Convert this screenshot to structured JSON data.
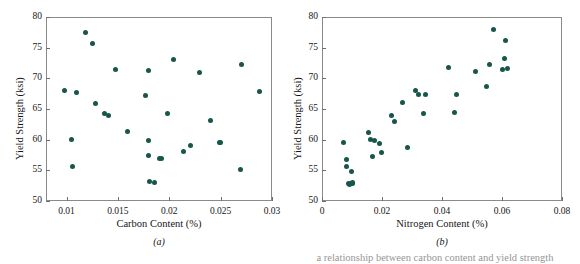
{
  "figure": {
    "caption_fragment": "a relationship between carbon content and yield strength",
    "point_color": "#17564a",
    "frame_color": "#8a8a8a"
  },
  "chart_data": [
    {
      "type": "scatter",
      "panel_label": "(a)",
      "title": "",
      "xlabel": "Carbon Content (%)",
      "ylabel": "Yield Strength (ksi)",
      "xlim": [
        0.008,
        0.03
      ],
      "ylim": [
        50,
        80
      ],
      "xticks": [
        0.01,
        0.015,
        0.02,
        0.025,
        0.03
      ],
      "xticklabels": [
        "0.01",
        "0.015",
        "0.02",
        "0.025",
        "0.03"
      ],
      "yticks": [
        50,
        55,
        60,
        65,
        70,
        75,
        80
      ],
      "yticklabels": [
        "50",
        "55",
        "60",
        "65",
        "70",
        "75",
        "80"
      ],
      "grid": false,
      "legend": "none",
      "x": [
        0.0098,
        0.0105,
        0.0106,
        0.011,
        0.0118,
        0.0125,
        0.0128,
        0.0137,
        0.0141,
        0.0148,
        0.0159,
        0.0177,
        0.018,
        0.018,
        0.018,
        0.0181,
        0.0186,
        0.019,
        0.0192,
        0.0198,
        0.0204,
        0.0214,
        0.0221,
        0.0229,
        0.024,
        0.0249,
        0.025,
        0.0269,
        0.027,
        0.0288
      ],
      "y": [
        68.0,
        60.0,
        55.6,
        67.7,
        77.5,
        75.6,
        65.9,
        64.2,
        63.9,
        71.5,
        61.3,
        67.2,
        71.2,
        59.8,
        57.4,
        53.2,
        53.0,
        56.9,
        56.9,
        64.3,
        73.0,
        58.1,
        59.0,
        71.0,
        63.2,
        59.6,
        59.6,
        55.2,
        72.3,
        67.8
      ]
    },
    {
      "type": "scatter",
      "panel_label": "(b)",
      "title": "",
      "xlabel": "Nitrogen Content (%)",
      "ylabel": "Yield Strength (ksi)",
      "xlim": [
        0,
        0.08
      ],
      "ylim": [
        50,
        80
      ],
      "xticks": [
        0,
        0.02,
        0.04,
        0.06,
        0.08
      ],
      "xticklabels": [
        "0",
        "0.02",
        "0.04",
        "0.06",
        "0.08"
      ],
      "yticks": [
        50,
        55,
        60,
        65,
        70,
        75,
        80
      ],
      "yticklabels": [
        "50",
        "55",
        "60",
        "65",
        "70",
        "75",
        "80"
      ],
      "grid": false,
      "legend": "none",
      "x": [
        0.0073,
        0.008,
        0.0082,
        0.0087,
        0.0092,
        0.0095,
        0.0098,
        0.01,
        0.0101,
        0.0155,
        0.0163,
        0.0168,
        0.0175,
        0.019,
        0.0197,
        0.0232,
        0.024,
        0.0268,
        0.0285,
        0.031,
        0.0322,
        0.0338,
        0.0345,
        0.042,
        0.0441,
        0.0449,
        0.051,
        0.0548,
        0.0558,
        0.057,
        0.06,
        0.0608,
        0.0612,
        0.0618
      ],
      "y": [
        59.6,
        55.7,
        56.7,
        52.9,
        52.7,
        52.9,
        54.8,
        53.0,
        52.8,
        61.2,
        60.1,
        57.3,
        59.8,
        59.3,
        57.9,
        63.9,
        63.0,
        66.1,
        58.8,
        68.0,
        67.4,
        64.3,
        67.4,
        71.8,
        64.4,
        67.4,
        71.1,
        68.6,
        72.3,
        78.0,
        71.5,
        73.2,
        76.1,
        71.6
      ]
    }
  ]
}
